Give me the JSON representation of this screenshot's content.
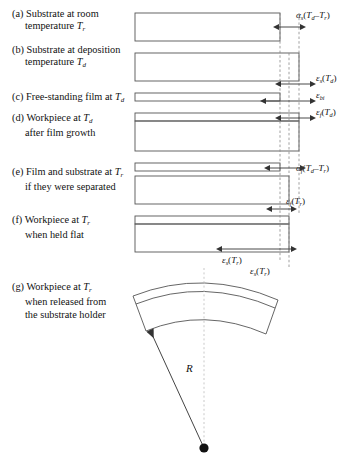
{
  "figure": {
    "type": "schematic-diagram",
    "background": "#ffffff",
    "line_color": "#555555",
    "dash_color": "#777777",
    "text_color": "#111111"
  },
  "rows": [
    {
      "key": "a",
      "tag": "(a)",
      "line1": "Substrate at room",
      "line2_pre": "temperature ",
      "line2_var": "T",
      "line2_sub": "r",
      "line2_post": "",
      "bar_kind": "substrate-only",
      "bar_right_ref": "inner"
    },
    {
      "key": "b",
      "tag": "(b)",
      "line1": "Substrate at deposition",
      "line2_pre": "temperature ",
      "line2_var": "T",
      "line2_sub": "d",
      "line2_post": "",
      "bar_kind": "substrate-only",
      "bar_right_ref": "outer"
    },
    {
      "key": "c",
      "tag": "(c)",
      "line1_pre": "Free-standing film at ",
      "line1_var": "T",
      "line1_sub": "d",
      "line2": "",
      "bar_kind": "film-only",
      "bar_right_ref": "left"
    },
    {
      "key": "d",
      "tag": "(d)",
      "line1_pre": "Workpiece at ",
      "line1_var": "T",
      "line1_sub": "d",
      "line2": "after film growth",
      "bar_kind": "workpiece",
      "bar_right_ref": "outer"
    },
    {
      "key": "e",
      "tag": "(e)",
      "line1_pre": "Film and substrate at ",
      "line1_var": "T",
      "line1_sub": "r",
      "line2": "if they were separated",
      "bar_kind": "separated",
      "bar_right_ref": "split"
    },
    {
      "key": "f",
      "tag": "(f)",
      "line1_pre": "Workpiece at ",
      "line1_var": "T",
      "line1_sub": "r",
      "line2": "when held flat",
      "bar_kind": "workpiece",
      "bar_right_ref": "mid"
    },
    {
      "key": "g",
      "tag": "(g)",
      "line1_pre": "Workpiece at ",
      "line1_var": "T",
      "line1_sub": "r",
      "line2": "when released from",
      "line3": "the substrate holder",
      "bar_kind": "curved-arc",
      "bar_right_ref": "none"
    }
  ],
  "measures": [
    {
      "id": "alpha-s-delta-t",
      "symbol": "α",
      "symbol_sub": "s",
      "body_open": "(",
      "v1": "T",
      "v1_sub": "d",
      "minus": "–",
      "v2": "T",
      "v2_sub": "r",
      "body_close": ")",
      "plain": "αs(Td – Tr)",
      "row": "a"
    },
    {
      "id": "eps-s-td",
      "symbol": "ε",
      "symbol_sub": "s",
      "body_open": "(",
      "v1": "T",
      "v1_sub": "d",
      "body_close": ")",
      "plain": "εs(Td)",
      "row": "b"
    },
    {
      "id": "eps-bi",
      "symbol": "ε",
      "symbol_sub": "bi",
      "plain": "εbi",
      "row": "c"
    },
    {
      "id": "eps-f-td",
      "symbol": "ε",
      "symbol_sub": "f",
      "body_open": "(",
      "v1": "T",
      "v1_sub": "d",
      "body_close": ")",
      "plain": "εf(Td)",
      "row": "d"
    },
    {
      "id": "alpha-f-delta-t",
      "symbol": "α",
      "symbol_sub": "f",
      "body_open": "(",
      "v1": "T",
      "v1_sub": "d",
      "minus": "–",
      "v2": "T",
      "v2_sub": "r",
      "body_close": ")",
      "plain": "αf(Td – Tr)",
      "row": "e"
    },
    {
      "id": "eps-f-tr",
      "symbol": "ε",
      "symbol_sub": "f",
      "body_open": "(",
      "v1": "T",
      "v1_sub": "r",
      "body_close": ")",
      "plain": "εf(Tr)",
      "row": "e-f"
    },
    {
      "id": "eps-s-tr",
      "symbol": "ε",
      "symbol_sub": "s",
      "body_open": "(",
      "v1": "T",
      "v1_sub": "r",
      "body_close": ")",
      "plain": "εs(Tr)",
      "row": "f"
    },
    {
      "id": "eps-s-tr-top",
      "symbol": "ε",
      "symbol_sub": "s",
      "body_open": "(",
      "v1": "T",
      "v1_sub": "r",
      "body_close": ")",
      "plain": "εs(Tr)",
      "row": "g"
    }
  ],
  "radius": {
    "label": "R",
    "description": "radius of curvature of released workpiece"
  }
}
